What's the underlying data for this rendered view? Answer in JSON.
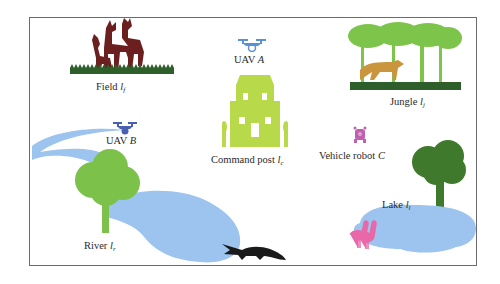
{
  "diagram": {
    "type": "scene-map",
    "border_color": "#6b6b6b",
    "locations": [
      {
        "id": "field",
        "name": "Field",
        "symbol": "l",
        "subscript": "f",
        "icon": "deer-grass-icon"
      },
      {
        "id": "jungle",
        "name": "Jungle",
        "symbol": "l",
        "subscript": "j",
        "icon": "jungle-cheetah-icon"
      },
      {
        "id": "command",
        "name": "Command post",
        "symbol": "l",
        "subscript": "c",
        "icon": "house-icon"
      },
      {
        "id": "river",
        "name": "River",
        "symbol": "l",
        "subscript": "r",
        "icon": "river-tree-icon"
      },
      {
        "id": "lake",
        "name": "Lake",
        "symbol": "l",
        "subscript": "l",
        "icon": "lake-tree-icon"
      }
    ],
    "agents": [
      {
        "id": "uav_a",
        "name": "UAV",
        "letter": "A",
        "icon": "drone-icon"
      },
      {
        "id": "uav_b",
        "name": "UAV",
        "letter": "B",
        "icon": "drone-icon"
      },
      {
        "id": "robot_c",
        "name": "Vehicle robot",
        "letter": "C",
        "icon": "robot-icon"
      }
    ],
    "decorations": [
      {
        "name": "crocodile",
        "icon": "crocodile-icon"
      },
      {
        "name": "flamingos",
        "icon": "flamingo-icon"
      }
    ],
    "colors": {
      "deer": "#6b1f1f",
      "grass": "#2e5e2a",
      "jungle_trees": "#7dc44a",
      "cheetah": "#c9963e",
      "house": "#b7d94a",
      "drone_a": "#5b8fd8",
      "drone_b": "#4a5fb0",
      "robot": "#c060b0",
      "water": "#9cc4ee",
      "river_tree": "#7cc24a",
      "lake_tree": "#3f7a2c",
      "crocodile": "#1a1a1a",
      "flamingo": "#e868a8"
    }
  }
}
